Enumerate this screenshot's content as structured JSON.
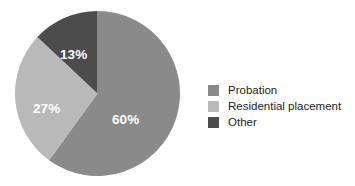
{
  "chart_data": {
    "type": "pie",
    "title": "",
    "subtitle": "",
    "xlabel": "",
    "ylabel": "",
    "grid": false,
    "legend_position": "right",
    "start_angle_deg": 0,
    "direction": "clockwise",
    "categories": [
      "Probation",
      "Residential placement",
      "Other"
    ],
    "values": [
      60,
      27,
      13
    ],
    "value_unit": "%",
    "data_labels": [
      "60%",
      "27%",
      "13%"
    ],
    "colors": [
      "#8a8a8a",
      "#b9b9b9",
      "#4c4c4c"
    ],
    "slices": [
      {
        "label": "Probation",
        "value": 60,
        "display": "60%",
        "color": "#8a8a8a"
      },
      {
        "label": "Residential placement",
        "value": 27,
        "display": "27%",
        "color": "#b9b9b9"
      },
      {
        "label": "Other",
        "value": 13,
        "display": "13%",
        "color": "#4c4c4c"
      }
    ]
  },
  "legend": {
    "items": [
      {
        "label": "Probation",
        "color": "#8a8a8a"
      },
      {
        "label": "Residential placement",
        "color": "#b9b9b9"
      },
      {
        "label": "Other",
        "color": "#4c4c4c"
      }
    ]
  },
  "canvas": {
    "background": "#ffffff",
    "label_text_color": "#ffffff",
    "legend_text_color": "#231f20"
  }
}
